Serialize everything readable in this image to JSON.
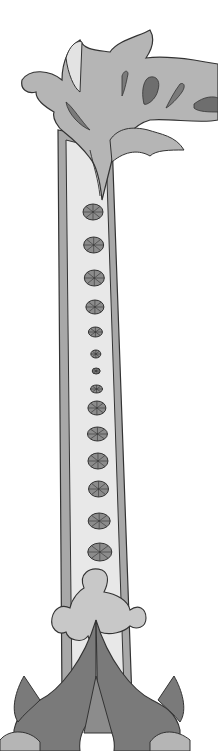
{
  "illustration": {
    "subject": "ornamental-column-letter-I",
    "colors": {
      "background": "#ffffff",
      "outline": "#333333",
      "leaf_light": "#b5b5b5",
      "leaf_dark": "#7a7a7a",
      "shaft_fill": "#e8e8e8",
      "border_band": "#a8a8a8",
      "medallion": "#8c8c8c"
    },
    "medallions": [
      {
        "cy": 212,
        "rx": 10,
        "ry": 8
      },
      {
        "cy": 245,
        "rx": 10,
        "ry": 8
      },
      {
        "cy": 278,
        "rx": 10,
        "ry": 8
      },
      {
        "cy": 307,
        "rx": 9,
        "ry": 7
      },
      {
        "cy": 332,
        "rx": 7,
        "ry": 5
      },
      {
        "cy": 354,
        "rx": 5,
        "ry": 4
      },
      {
        "cy": 371,
        "rx": 4,
        "ry": 3
      },
      {
        "cy": 389,
        "rx": 6,
        "ry": 4
      },
      {
        "cy": 408,
        "rx": 9,
        "ry": 7
      },
      {
        "cy": 434,
        "rx": 10,
        "ry": 7
      },
      {
        "cy": 461,
        "rx": 10,
        "ry": 8
      },
      {
        "cy": 489,
        "rx": 10,
        "ry": 8
      },
      {
        "cy": 521,
        "rx": 11,
        "ry": 8
      },
      {
        "cy": 552,
        "rx": 12,
        "ry": 9
      }
    ]
  }
}
